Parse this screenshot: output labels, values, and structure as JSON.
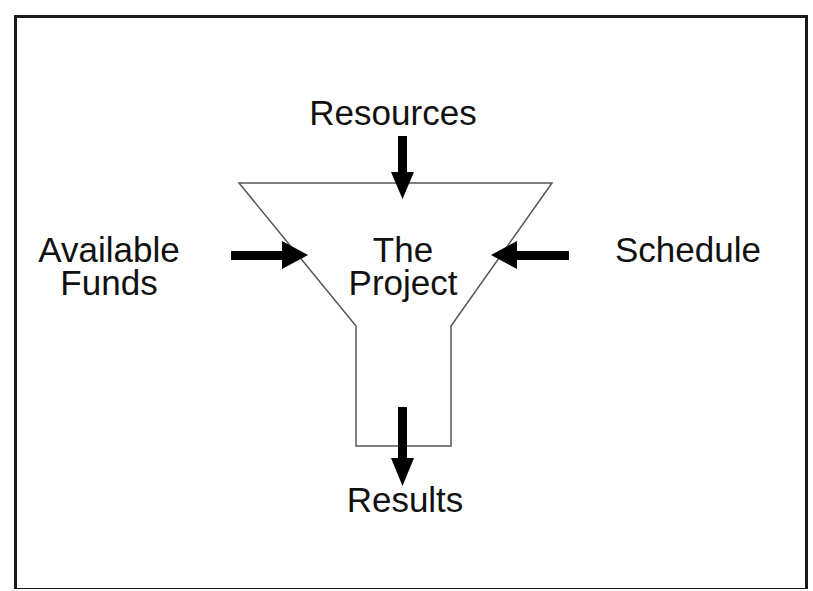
{
  "diagram": {
    "type": "funnel",
    "center_label_line1": "The",
    "center_label_line2": "Project",
    "inputs": {
      "top": "Resources",
      "left_line1": "Available",
      "left_line2": "Funds",
      "right": "Schedule"
    },
    "output": "Results"
  },
  "colors": {
    "stroke": "#555555",
    "arrow": "#000000",
    "text": "#111111",
    "background": "#ffffff"
  }
}
